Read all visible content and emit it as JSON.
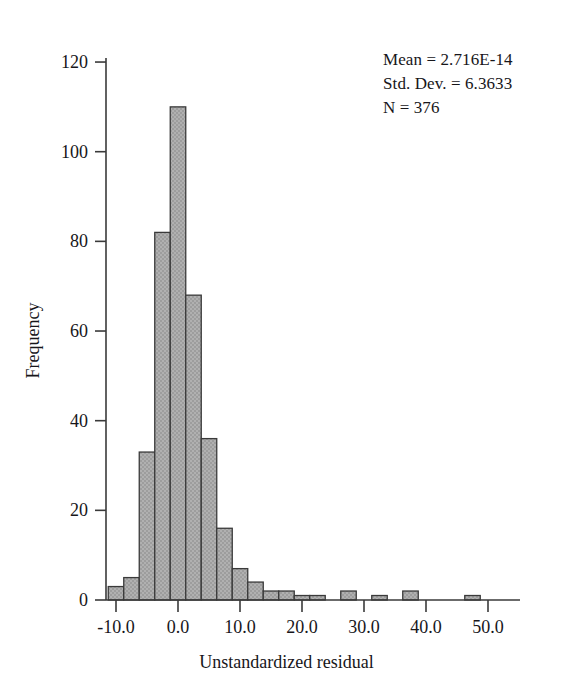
{
  "figure": {
    "background_color": "#ffffff",
    "bar_fill_color": "#a9a9a9",
    "bar_border_color": "#3a3a3a",
    "axis_color": "#3a3a3a"
  },
  "annotations": {
    "mean_line": "Mean = 2.716E-14",
    "std_dev_line": "Std. Dev. = 6.3633",
    "n_line": "N = 376"
  },
  "chart_data": {
    "type": "bar",
    "title": "",
    "xlabel": "Unstandardized residual",
    "ylabel": "Frequency",
    "xlim": [
      -13.0,
      51.5
    ],
    "ylim": [
      0,
      126
    ],
    "grid": false,
    "legend": null,
    "bin_width": 2.5,
    "xticks": [
      -10.0,
      0.0,
      10.0,
      20.0,
      30.0,
      40.0,
      50.0
    ],
    "xtick_labels": [
      "-10.0",
      "0.0",
      "10.0",
      "20.0",
      "30.0",
      "40.0",
      "50.0"
    ],
    "yticks": [
      0,
      20,
      40,
      60,
      80,
      100,
      120
    ],
    "ytick_labels": [
      "0",
      "20",
      "40",
      "60",
      "80",
      "100",
      "120"
    ],
    "bins": [
      {
        "left": -11.25,
        "right": -8.75,
        "center": -10.0,
        "value": 3
      },
      {
        "left": -8.75,
        "right": -6.25,
        "center": -7.5,
        "value": 5
      },
      {
        "left": -6.25,
        "right": -3.75,
        "center": -5.0,
        "value": 33
      },
      {
        "left": -3.75,
        "right": -1.25,
        "center": -2.5,
        "value": 82
      },
      {
        "left": -1.25,
        "right": 1.25,
        "center": 0.0,
        "value": 110
      },
      {
        "left": 1.25,
        "right": 3.75,
        "center": 2.5,
        "value": 68
      },
      {
        "left": 3.75,
        "right": 6.25,
        "center": 5.0,
        "value": 36
      },
      {
        "left": 6.25,
        "right": 8.75,
        "center": 7.5,
        "value": 16
      },
      {
        "left": 8.75,
        "right": 11.25,
        "center": 10.0,
        "value": 7
      },
      {
        "left": 11.25,
        "right": 13.75,
        "center": 12.5,
        "value": 4
      },
      {
        "left": 13.75,
        "right": 16.25,
        "center": 15.0,
        "value": 2
      },
      {
        "left": 16.25,
        "right": 18.75,
        "center": 17.5,
        "value": 2
      },
      {
        "left": 18.75,
        "right": 21.25,
        "center": 20.0,
        "value": 1
      },
      {
        "left": 21.25,
        "right": 23.75,
        "center": 22.5,
        "value": 1
      },
      {
        "left": 26.25,
        "right": 28.75,
        "center": 27.5,
        "value": 2
      },
      {
        "left": 31.25,
        "right": 33.75,
        "center": 32.5,
        "value": 1
      },
      {
        "left": 36.25,
        "right": 38.75,
        "center": 37.5,
        "value": 2
      },
      {
        "left": 46.25,
        "right": 48.75,
        "center": 47.5,
        "value": 1
      }
    ],
    "categories": [
      -10.0,
      -7.5,
      -5.0,
      -2.5,
      0.0,
      2.5,
      5.0,
      7.5,
      10.0,
      12.5,
      15.0,
      17.5,
      20.0,
      22.5,
      27.5,
      32.5,
      37.5,
      47.5
    ],
    "values": [
      3,
      5,
      33,
      82,
      110,
      68,
      36,
      16,
      7,
      4,
      2,
      2,
      1,
      1,
      2,
      1,
      2,
      1
    ]
  }
}
